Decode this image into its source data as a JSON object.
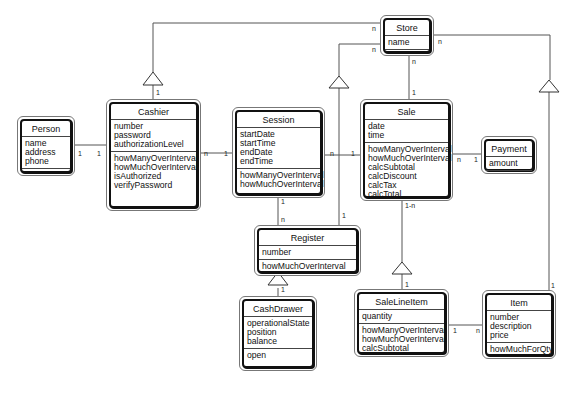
{
  "diagram": {
    "type": "UML class diagram",
    "classes": {
      "store": {
        "name": "Store",
        "attributes": [
          "name"
        ],
        "operations": []
      },
      "person": {
        "name": "Person",
        "attributes": [
          "name",
          "address",
          "phone"
        ],
        "operations": []
      },
      "cashier": {
        "name": "Cashier",
        "attributes": [
          "number",
          "password",
          "authorizationLevel"
        ],
        "operations": [
          "howManyOverInterval",
          "howMuchOverInterval",
          "isAuthorized",
          "verifyPassword"
        ]
      },
      "session": {
        "name": "Session",
        "attributes": [
          "startDate",
          "startTime",
          "endDate",
          "endTime"
        ],
        "operations": [
          "howManyOverInterval",
          "howMuchOverInterval"
        ]
      },
      "sale": {
        "name": "Sale",
        "attributes": [
          "date",
          "time"
        ],
        "operations": [
          "howManyOverInterval",
          "howMuchOverInterval",
          "calcSubtotal",
          "calcDiscount",
          "calcTax",
          "calcTotal"
        ]
      },
      "payment": {
        "name": "Payment",
        "attributes": [
          "amount"
        ],
        "operations": []
      },
      "register": {
        "name": "Register",
        "attributes": [
          "number"
        ],
        "operations": [
          "howMuchOverInterval"
        ]
      },
      "cashdrawer": {
        "name": "CashDrawer",
        "attributes": [
          "operationalState",
          "position",
          "balance"
        ],
        "operations": [
          "open"
        ]
      },
      "salelineitem": {
        "name": "SaleLineItem",
        "attributes": [
          "quantity"
        ],
        "operations": [
          "howManyOverInterval",
          "howMuchOverInterval",
          "calcSubtotal"
        ]
      },
      "item": {
        "name": "Item",
        "attributes": [
          "number",
          "description",
          "price"
        ],
        "operations": [
          "howMuchForQty"
        ]
      }
    },
    "associations": [
      {
        "from": "Store",
        "to": "Cashier",
        "kind": "aggregation",
        "mult_from": "n",
        "mult_to": "1"
      },
      {
        "from": "Store",
        "to": "Register",
        "kind": "aggregation",
        "mult_from": "n",
        "mult_to": "1"
      },
      {
        "from": "Store",
        "to": "Sale",
        "kind": "association",
        "mult_from": "n",
        "mult_to": "1"
      },
      {
        "from": "Store",
        "to": "Item",
        "kind": "aggregation",
        "mult_from": "n",
        "mult_to": "1"
      },
      {
        "from": "Person",
        "to": "Cashier",
        "kind": "association",
        "mult_from": "1",
        "mult_to": "1"
      },
      {
        "from": "Cashier",
        "to": "Session",
        "kind": "association",
        "mult_from": "n",
        "mult_to": "1"
      },
      {
        "from": "Session",
        "to": "Sale",
        "kind": "association",
        "mult_from": "n",
        "mult_to": "1"
      },
      {
        "from": "Session",
        "to": "Register",
        "kind": "association",
        "mult_from": "1",
        "mult_to": "n"
      },
      {
        "from": "Sale",
        "to": "Payment",
        "kind": "association",
        "mult_from": "n",
        "mult_to": "1"
      },
      {
        "from": "Sale",
        "to": "SaleLineItem",
        "kind": "aggregation",
        "mult_from": "1-n",
        "mult_to": "1"
      },
      {
        "from": "Register",
        "to": "CashDrawer",
        "kind": "aggregation",
        "mult_from": "1",
        "mult_to": "1"
      },
      {
        "from": "SaleLineItem",
        "to": "Item",
        "kind": "association",
        "mult_from": "1",
        "mult_to": "n"
      }
    ],
    "labels": {
      "n": "n",
      "one": "1",
      "one_to_n": "1-n"
    }
  }
}
